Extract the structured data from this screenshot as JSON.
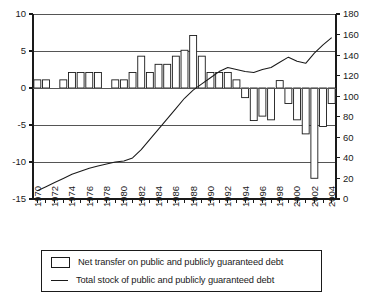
{
  "chart_data": {
    "type": "bar",
    "title": "",
    "subtitle": "",
    "xlabel": "",
    "ylabel": "",
    "y2label": "",
    "grid": true,
    "legend_position": "bottom",
    "x": [
      1970,
      1971,
      1972,
      1973,
      1974,
      1975,
      1976,
      1977,
      1978,
      1979,
      1980,
      1981,
      1982,
      1983,
      1984,
      1985,
      1986,
      1987,
      1988,
      1989,
      1990,
      1991,
      1992,
      1993,
      1994,
      1995,
      1996,
      1997,
      1998,
      1999,
      2000,
      2001,
      2002,
      2003,
      2004
    ],
    "tick_labels": [
      "1970",
      "1972",
      "1974",
      "1976",
      "1978",
      "1980",
      "1982",
      "1984",
      "1986",
      "1988",
      "1990",
      "1992",
      "1994",
      "1996",
      "1998",
      "2000",
      "2002",
      "2004"
    ],
    "yticks": [
      10,
      5,
      0,
      -5,
      -10,
      -15
    ],
    "ylim": [
      -15,
      10
    ],
    "y2ticks": [
      180,
      160,
      140,
      120,
      100,
      80,
      60,
      40,
      20,
      0
    ],
    "y2lim": [
      0,
      180
    ],
    "series": [
      {
        "name": "Net transfer on public and publicly guaranteed debt",
        "type": "bar",
        "axis": "left",
        "values": [
          1.1,
          1.1,
          0.0,
          1.1,
          2.1,
          2.1,
          2.1,
          2.1,
          0.0,
          1.1,
          1.1,
          2.1,
          4.3,
          2.1,
          3.2,
          3.2,
          4.3,
          5.1,
          7.1,
          4.3,
          2.1,
          2.1,
          2.1,
          1.1,
          -1.3,
          -4.4,
          -3.8,
          -4.3,
          1.0,
          -2.1,
          -4.3,
          -6.2,
          -12.2,
          -5.2,
          -2.1
        ]
      },
      {
        "name": "Total stock of public and publicly guaranteed debt",
        "type": "line",
        "axis": "right",
        "values": [
          8,
          12,
          16,
          20,
          24,
          27,
          30,
          32,
          34,
          36,
          37,
          40,
          48,
          58,
          68,
          78,
          88,
          98,
          106,
          112,
          118,
          124,
          128,
          126,
          124,
          123,
          126,
          128,
          133,
          138,
          134,
          132,
          142,
          150,
          157
        ]
      }
    ]
  },
  "legend": {
    "items": [
      {
        "marker": "bar-swatch",
        "label": "Net transfer on public and publicly guaranteed debt"
      },
      {
        "marker": "line-swatch",
        "label": "Total stock of public and publicly guaranteed debt"
      }
    ]
  }
}
